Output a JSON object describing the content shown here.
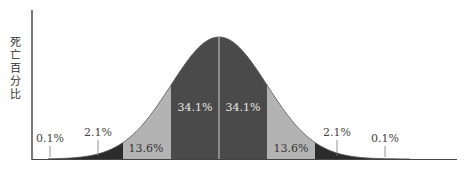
{
  "chart_data": {
    "type": "area",
    "title": "",
    "xlabel": "",
    "ylabel": "死亡百分比",
    "distribution": "normal",
    "mean_px": 219,
    "sigma_px": 48,
    "bands": [
      {
        "from_sigma": -4,
        "to_sigma": -2,
        "label": "2.1%",
        "value": 2.1,
        "color": "#2b2b2b"
      },
      {
        "from_sigma": -2,
        "to_sigma": -1,
        "label": "13.6%",
        "value": 13.6,
        "color": "#b3b3b3"
      },
      {
        "from_sigma": -1,
        "to_sigma": 0,
        "label": "34.1%",
        "value": 34.1,
        "color": "#4a4a4a"
      },
      {
        "from_sigma": 0,
        "to_sigma": 1,
        "label": "34.1%",
        "value": 34.1,
        "color": "#4a4a4a"
      },
      {
        "from_sigma": 1,
        "to_sigma": 2,
        "label": "13.6%",
        "value": 13.6,
        "color": "#b3b3b3"
      },
      {
        "from_sigma": 2,
        "to_sigma": 4,
        "label": "2.1%",
        "value": 2.1,
        "color": "#2b2b2b"
      }
    ],
    "tail_labels": [
      {
        "side": "left",
        "label": "0.1%",
        "value": 0.1
      },
      {
        "side": "right",
        "label": "0.1%",
        "value": 0.1
      }
    ],
    "grid": false,
    "legend": "none"
  },
  "y_axis_label": "死亡百分比"
}
